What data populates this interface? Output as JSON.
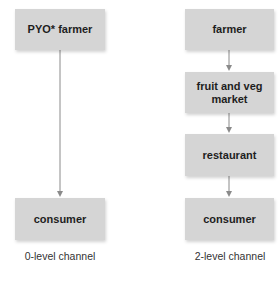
{
  "diagram": {
    "type": "distribution-channels",
    "colors": {
      "box_fill": "#d5d5d5",
      "arrow": "#8a8a8a",
      "text": "#1e1e1e"
    },
    "channels": [
      {
        "label": "0-level channel",
        "nodes": [
          "PYO* farmer",
          "consumer"
        ]
      },
      {
        "label": "2-level channel",
        "nodes": [
          "farmer",
          "fruit and veg market",
          "restaurant",
          "consumer"
        ]
      }
    ]
  }
}
